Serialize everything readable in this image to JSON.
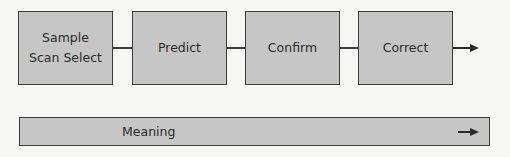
{
  "diagram": {
    "steps": [
      {
        "label": "Sample\nScan Select"
      },
      {
        "label": "Predict"
      },
      {
        "label": "Confirm"
      },
      {
        "label": "Correct"
      }
    ],
    "bar": {
      "label": "Meaning"
    }
  },
  "colors": {
    "box_fill": "#c6c6c6",
    "border": "#3c3c3c",
    "background": "#f6f6f4"
  }
}
